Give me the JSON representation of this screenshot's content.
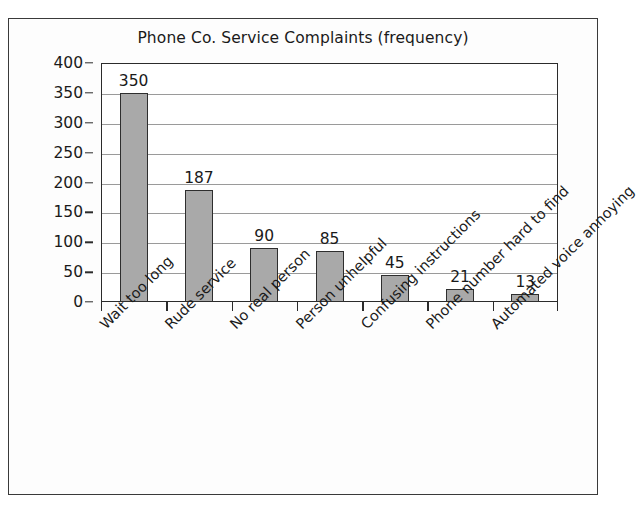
{
  "chart_data": {
    "type": "bar",
    "title": "Phone Co. Service Complaints (frequency)",
    "xlabel": "",
    "ylabel": "",
    "ylim": [
      0,
      400
    ],
    "ytick_step": 50,
    "grid": true,
    "legend": false,
    "orientation": "vertical",
    "bar_color": "#a9a9a9",
    "bar_border_color": "#2e2e2e",
    "categories": [
      "Wait too long",
      "Rude service",
      "No real person",
      "Person unhelpful",
      "Confusing instructions",
      "Phone number hard to find",
      "Automated voice annoying"
    ],
    "values": [
      350,
      187,
      90,
      85,
      45,
      21,
      13
    ],
    "data_labels": [
      "350",
      "187",
      "90",
      "85",
      "45",
      "21",
      "13"
    ],
    "ytick_labels": [
      "400",
      "350",
      "300",
      "250",
      "200",
      "150",
      "100",
      "50",
      "0"
    ],
    "ytick_values": [
      400,
      350,
      300,
      250,
      200,
      150,
      100,
      50,
      0
    ]
  }
}
